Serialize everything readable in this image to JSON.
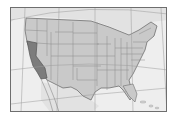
{
  "map": {
    "title": "Map of the contiguous United States with California highlighted",
    "highlighted_state": "California",
    "colors": {
      "background": "#ffffff",
      "ocean": "#eeeeee",
      "land": "#c9c9c9",
      "highlight": "#7c7c7c",
      "border": "#6e6e6e",
      "state_lines": "#8a8a8a",
      "graticule": "#9a9a9a"
    }
  }
}
